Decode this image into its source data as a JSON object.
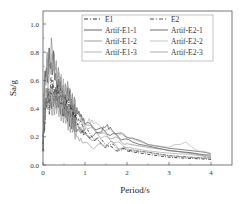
{
  "chart_data": {
    "type": "line",
    "title": "",
    "xlabel": "Period/s",
    "ylabel": "Sa/g",
    "xlim": [
      0,
      4.5
    ],
    "ylim": [
      0,
      1.1
    ],
    "xticks": [
      "0",
      "1",
      "2",
      "3",
      "4"
    ],
    "yticks": [
      "0.0",
      "0.2",
      "0.4",
      "0.6",
      "0.8",
      "1.0"
    ],
    "grid": false,
    "legend_position": "upper-right",
    "series": [
      {
        "name": "E1",
        "style": "dash-dot",
        "color": "#333333",
        "x": [
          0,
          0.05,
          0.1,
          0.15,
          0.2,
          0.3,
          0.4,
          0.5,
          0.6,
          0.7,
          0.8,
          0.9,
          1.0,
          1.2,
          1.4,
          1.6,
          1.8,
          2.0,
          2.5,
          3.0,
          3.5,
          4.0
        ],
        "values": [
          0.15,
          0.35,
          0.5,
          0.42,
          0.55,
          0.45,
          0.5,
          0.38,
          0.42,
          0.35,
          0.3,
          0.25,
          0.22,
          0.18,
          0.15,
          0.12,
          0.11,
          0.1,
          0.08,
          0.06,
          0.05,
          0.04
        ]
      },
      {
        "name": "E2",
        "style": "dash-dot",
        "color": "#555555",
        "x": [
          0,
          0.05,
          0.1,
          0.15,
          0.2,
          0.3,
          0.4,
          0.5,
          0.6,
          0.7,
          0.8,
          0.9,
          1.0,
          1.2,
          1.4,
          1.6,
          1.8,
          2.0,
          2.5,
          3.0,
          3.5,
          4.0
        ],
        "values": [
          0.15,
          0.4,
          0.55,
          0.45,
          0.6,
          0.5,
          0.55,
          0.45,
          0.4,
          0.38,
          0.33,
          0.3,
          0.25,
          0.2,
          0.17,
          0.14,
          0.12,
          0.1,
          0.09,
          0.07,
          0.06,
          0.05
        ]
      },
      {
        "name": "Artif-E1-1",
        "style": "solid",
        "color": "#222222",
        "x": [
          0,
          0.05,
          0.1,
          0.15,
          0.2,
          0.25,
          0.3,
          0.4,
          0.5,
          0.6,
          0.7,
          0.8,
          0.9,
          1.0,
          1.2,
          1.4,
          1.6,
          1.8,
          2.0,
          2.2,
          2.5,
          3.0,
          3.5,
          4.0
        ],
        "values": [
          0.15,
          0.7,
          0.6,
          0.8,
          0.65,
          0.75,
          0.6,
          0.55,
          0.45,
          0.5,
          0.4,
          0.38,
          0.35,
          0.3,
          0.27,
          0.25,
          0.22,
          0.2,
          0.18,
          0.16,
          0.13,
          0.1,
          0.09,
          0.07
        ]
      },
      {
        "name": "Artif-E1-2",
        "style": "solid",
        "color": "#777777",
        "x": [
          0,
          0.05,
          0.1,
          0.15,
          0.2,
          0.3,
          0.4,
          0.5,
          0.6,
          0.7,
          0.8,
          0.9,
          1.0,
          1.2,
          1.4,
          1.6,
          1.8,
          2.0,
          2.5,
          3.0,
          3.5,
          4.0
        ],
        "values": [
          0.15,
          0.6,
          0.75,
          0.65,
          0.85,
          0.7,
          0.6,
          0.5,
          0.55,
          0.45,
          0.4,
          0.35,
          0.3,
          0.25,
          0.22,
          0.2,
          0.18,
          0.15,
          0.12,
          0.1,
          0.08,
          0.06
        ]
      },
      {
        "name": "Artif-E1-3",
        "style": "solid",
        "color": "#999999",
        "x": [
          0,
          0.05,
          0.1,
          0.15,
          0.2,
          0.3,
          0.4,
          0.5,
          0.6,
          0.7,
          0.8,
          0.9,
          1.0,
          1.2,
          1.4,
          1.6,
          1.8,
          2.0,
          2.5,
          3.0,
          3.5,
          4.0
        ],
        "values": [
          0.15,
          0.55,
          0.7,
          0.6,
          0.75,
          0.65,
          0.6,
          0.55,
          0.5,
          0.45,
          0.4,
          0.33,
          0.28,
          0.25,
          0.2,
          0.18,
          0.15,
          0.13,
          0.1,
          0.08,
          0.07,
          0.05
        ]
      },
      {
        "name": "Artif-E2-1",
        "style": "solid",
        "color": "#333333",
        "x": [
          0,
          0.05,
          0.1,
          0.2,
          0.3,
          0.4,
          0.5,
          0.6,
          0.7,
          0.8,
          1.0,
          1.2,
          1.4,
          1.5,
          1.6,
          1.8,
          2.0,
          2.2,
          2.5,
          3.0,
          3.5,
          4.0
        ],
        "values": [
          0.15,
          0.4,
          0.5,
          0.45,
          0.5,
          0.42,
          0.4,
          0.35,
          0.3,
          0.25,
          0.22,
          0.2,
          0.25,
          0.28,
          0.26,
          0.22,
          0.2,
          0.18,
          0.15,
          0.12,
          0.1,
          0.08
        ]
      },
      {
        "name": "Artif-E2-2",
        "style": "solid",
        "color": "#aaaaaa",
        "x": [
          0,
          0.05,
          0.1,
          0.2,
          0.3,
          0.4,
          0.5,
          0.6,
          0.7,
          0.8,
          0.9,
          1.0,
          1.1,
          1.2,
          1.4,
          1.6,
          1.8,
          2.0,
          2.5,
          3.0,
          3.4,
          3.7,
          4.0
        ],
        "values": [
          0.15,
          0.45,
          0.55,
          0.5,
          0.45,
          0.5,
          0.42,
          0.38,
          0.32,
          0.28,
          0.25,
          0.28,
          0.32,
          0.3,
          0.26,
          0.24,
          0.22,
          0.2,
          0.15,
          0.13,
          0.16,
          0.1,
          0.08
        ]
      },
      {
        "name": "Artif-E2-3",
        "style": "solid",
        "color": "#888888",
        "x": [
          0,
          0.05,
          0.1,
          0.2,
          0.3,
          0.4,
          0.5,
          0.6,
          0.7,
          0.8,
          1.0,
          1.2,
          1.4,
          1.6,
          1.8,
          2.0,
          2.5,
          3.0,
          3.5,
          4.0
        ],
        "values": [
          0.15,
          0.38,
          0.45,
          0.4,
          0.42,
          0.38,
          0.35,
          0.3,
          0.28,
          0.2,
          0.15,
          0.13,
          0.14,
          0.16,
          0.13,
          0.11,
          0.09,
          0.07,
          0.06,
          0.05
        ]
      }
    ]
  }
}
